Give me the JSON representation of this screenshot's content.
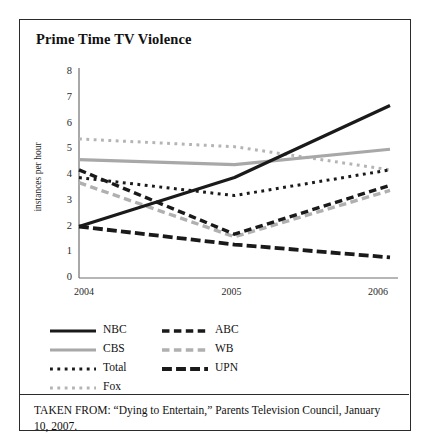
{
  "figure": {
    "title": "Prime Time TV Violence",
    "caption": "TAKEN FROM: “Dying to Entertain,” Parents Television Council, January 10, 2007."
  },
  "chart_data": {
    "type": "line",
    "title": "Prime Time TV Violence",
    "xlabel": "",
    "ylabel": "instances per hour",
    "categories": [
      "2004",
      "2005",
      "2006"
    ],
    "x": [
      2004,
      2005,
      2006
    ],
    "xtick_labels": [
      "2004",
      "2005",
      "2006"
    ],
    "ytick_labels": [
      "0",
      "1",
      "2",
      "3",
      "4",
      "5",
      "6",
      "7",
      "8"
    ],
    "ylim": [
      0,
      8
    ],
    "ytick_step": 1,
    "grid": false,
    "legend_position": "below-plot",
    "series": [
      {
        "name": "NBC",
        "values": [
          2.0,
          3.9,
          6.7
        ],
        "style": "solid",
        "color": "#1a1a1a",
        "width": 3.2
      },
      {
        "name": "CBS",
        "values": [
          4.6,
          4.4,
          5.0
        ],
        "style": "solid",
        "color": "#a8a8a8",
        "width": 3.2
      },
      {
        "name": "Total",
        "values": [
          3.9,
          3.2,
          4.2
        ],
        "style": "dotted",
        "color": "#1a1a1a",
        "width": 3.0
      },
      {
        "name": "Fox",
        "values": [
          5.4,
          5.1,
          4.2
        ],
        "style": "dotted",
        "color": "#b4b4b4",
        "width": 3.0
      },
      {
        "name": "ABC",
        "values": [
          4.2,
          1.7,
          3.6
        ],
        "style": "dashed",
        "color": "#1a1a1a",
        "width": 3.4
      },
      {
        "name": "WB",
        "values": [
          3.7,
          1.6,
          3.4
        ],
        "style": "dashed",
        "color": "#b0b0b0",
        "width": 3.4
      },
      {
        "name": "UPN",
        "values": [
          2.0,
          1.3,
          0.8
        ],
        "style": "long-dashed",
        "color": "#1a1a1a",
        "width": 3.8
      }
    ]
  },
  "legend": {
    "column_1": [
      {
        "label": "NBC",
        "swatch": "solid-black-line-swatch"
      },
      {
        "label": "CBS",
        "swatch": "solid-gray-line-swatch"
      },
      {
        "label": "Total",
        "swatch": "dotted-black-line-swatch"
      },
      {
        "label": "Fox",
        "swatch": "dotted-gray-line-swatch"
      }
    ],
    "column_2": [
      {
        "label": "ABC",
        "swatch": "dashed-black-line-swatch"
      },
      {
        "label": "WB",
        "swatch": "dashed-gray-line-swatch"
      },
      {
        "label": "UPN",
        "swatch": "long-dashed-black-line-swatch"
      }
    ]
  },
  "colors": {
    "black_series": "#1a1a1a",
    "gray_series": "#acacac",
    "axis": "#6e6e6e",
    "border": "#2b2b2b",
    "background": "#ffffff"
  }
}
